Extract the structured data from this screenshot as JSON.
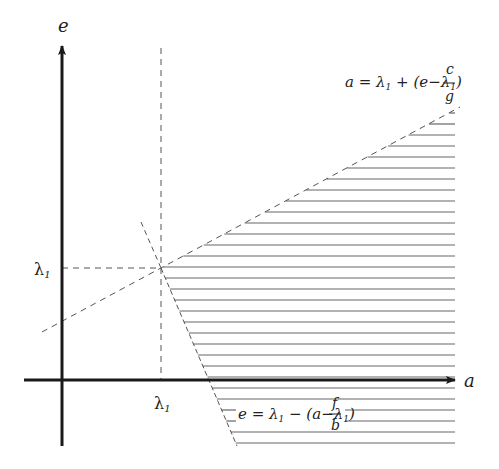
{
  "diagram": {
    "axes": {
      "x_label": "a",
      "y_label": "e",
      "x_tick_label": "λ",
      "x_tick_sub": "1",
      "y_tick_label": "λ",
      "y_tick_sub": "1"
    },
    "upper_boundary": {
      "lhs": "a = λ",
      "sub1": "1",
      "mid": " + (e−λ",
      "sub2": "1",
      "close": ")",
      "numerator": "c",
      "denominator": "g"
    },
    "lower_boundary": {
      "lhs": "e = λ",
      "sub1": "1",
      "mid": " − (a−λ",
      "sub2": "1",
      "close": ")",
      "numerator": "f",
      "denominator": "b"
    },
    "colors": {
      "axis": "#1a1a1a",
      "dashed": "#555555",
      "hatch": "#666666"
    }
  }
}
